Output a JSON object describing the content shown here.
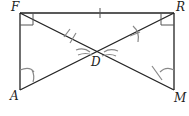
{
  "figure": {
    "type": "geometry",
    "points": {
      "F": {
        "label": "F",
        "x": 20,
        "y": 13
      },
      "R": {
        "label": "R",
        "x": 174,
        "y": 13
      },
      "A": {
        "label": "A",
        "x": 20,
        "y": 90
      },
      "M": {
        "label": "M",
        "x": 174,
        "y": 90
      },
      "D": {
        "label": "D",
        "x": 97,
        "y": 51
      }
    },
    "segments": [
      "FR",
      "FA",
      "RM",
      "FM",
      "RA"
    ],
    "right_angles": [
      "F",
      "R"
    ],
    "tick_marks": [
      {
        "segment": "FR",
        "count": 1
      }
    ],
    "colors": {
      "lines": "#222222",
      "marks": "#888888"
    }
  }
}
